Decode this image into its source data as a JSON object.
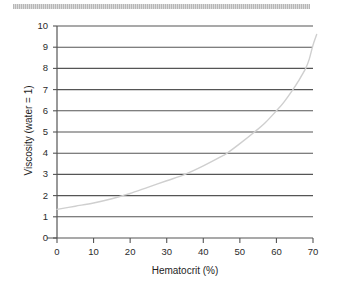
{
  "figure": {
    "background_color": "#ffffff",
    "top_rule": {
      "name": "decorative-rule",
      "color": "#c8c8c8"
    }
  },
  "chart_data": {
    "type": "line",
    "title": "",
    "subtitle": "",
    "xlabel": "Hematocrit (%)",
    "ylabel": "Viscosity (water = 1)",
    "xlim": [
      0,
      70
    ],
    "ylim": [
      0,
      10
    ],
    "xticks": [
      0,
      10,
      20,
      30,
      40,
      50,
      60,
      70
    ],
    "yticks": [
      0,
      1,
      2,
      3,
      4,
      5,
      6,
      7,
      8,
      9,
      10
    ],
    "xtick_labels": [
      "0",
      "10",
      "20",
      "30",
      "40",
      "50",
      "60",
      "70"
    ],
    "ytick_labels": [
      "0",
      "1",
      "2",
      "3",
      "4",
      "5",
      "6",
      "7",
      "8",
      "9",
      "10"
    ],
    "grid": {
      "horizontal": true,
      "vertical": false,
      "color": "#555555",
      "levels": [
        1,
        2,
        3,
        4,
        5,
        6,
        7,
        8,
        9,
        10
      ]
    },
    "legend": {
      "visible": false,
      "position": "none",
      "entries": []
    },
    "annotations": [],
    "series": [
      {
        "name": "Blood viscosity vs hematocrit",
        "color": "#cfcfcf",
        "line_width": 1.4,
        "x": [
          0,
          5,
          10,
          15,
          18,
          20,
          25,
          30,
          35,
          40,
          45,
          46.5,
          50,
          54,
          57,
          60,
          62,
          64.5,
          66,
          68,
          69,
          70,
          71
        ],
        "y": [
          1.35,
          1.5,
          1.65,
          1.85,
          2.0,
          2.1,
          2.4,
          2.7,
          3.0,
          3.4,
          3.85,
          4.0,
          4.45,
          5.0,
          5.45,
          6.0,
          6.4,
          7.0,
          7.4,
          8.0,
          8.45,
          9.1,
          9.6
        ]
      }
    ]
  },
  "axes": {
    "x_axis_name": "x-axis",
    "y_axis_name": "y-axis",
    "axis_color": "#555555",
    "tick_color": "#555555"
  }
}
